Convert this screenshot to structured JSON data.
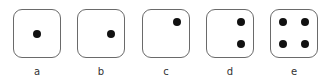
{
  "dice": [
    {
      "label": "a",
      "x": 13,
      "pips": [
        [
          50,
          50
        ]
      ]
    },
    {
      "label": "b",
      "x": 77,
      "pips": [
        [
          72,
          50
        ]
      ]
    },
    {
      "label": "c",
      "x": 142,
      "pips": [
        [
          73,
          26
        ]
      ]
    },
    {
      "label": "d",
      "x": 206,
      "pips": [
        [
          73,
          26
        ],
        [
          73,
          73
        ]
      ]
    },
    {
      "label": "e",
      "x": 270,
      "pips": [
        [
          27,
          26
        ],
        [
          73,
          26
        ],
        [
          27,
          73
        ],
        [
          73,
          73
        ]
      ]
    }
  ]
}
